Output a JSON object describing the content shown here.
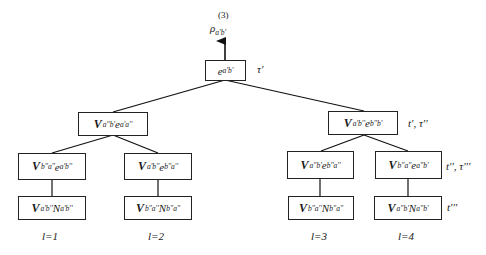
{
  "diagram": {
    "root_output": {
      "number": "(3)",
      "symbol": "ρ",
      "subscript": "a'b'"
    },
    "nodes": {
      "root": {
        "prefix": "",
        "term": "e",
        "sub": "a'b'",
        "side_label": "τ'"
      },
      "l2_left": {
        "prefix": "V",
        "prefix_sub": "a''b'",
        "term": "e",
        "sub": "a'a''",
        "side_label": ""
      },
      "l2_right": {
        "prefix": "V",
        "prefix_sub": "a'b''",
        "term": "e",
        "sub": "b''b'",
        "side_label": "t', τ''"
      },
      "l3_ll": {
        "prefix": "V",
        "prefix_sub": "b''a''",
        "term": "e",
        "sub": "a'b''",
        "side_label": ""
      },
      "l3_lr": {
        "prefix": "V",
        "prefix_sub": "a'b''",
        "term": "e",
        "sub": "b''a''",
        "side_label": ""
      },
      "l3_rl": {
        "prefix": "V",
        "prefix_sub": "a''b'",
        "term": "e",
        "sub": "b''a''",
        "side_label": ""
      },
      "l3_rr": {
        "prefix": "V",
        "prefix_sub": "b''a''",
        "term": "e",
        "sub": "a''b'",
        "side_label": "t'', τ'''"
      },
      "l4_ll": {
        "prefix": "V",
        "prefix_sub": "a'b''",
        "term": "N",
        "sub": "a'b''",
        "side_label": ""
      },
      "l4_lr": {
        "prefix": "V",
        "prefix_sub": "b''a''",
        "term": "N",
        "sub": "b''a''",
        "side_label": ""
      },
      "l4_rl": {
        "prefix": "V",
        "prefix_sub": "b''a''",
        "term": "N",
        "sub": "b''a''",
        "side_label": ""
      },
      "l4_rr": {
        "prefix": "V",
        "prefix_sub": "a''b'",
        "term": "N",
        "sub": "a''b'",
        "side_label": "t'''"
      }
    },
    "leaf_labels": [
      "l=1",
      "l=2",
      "l=3",
      "l=4"
    ]
  }
}
